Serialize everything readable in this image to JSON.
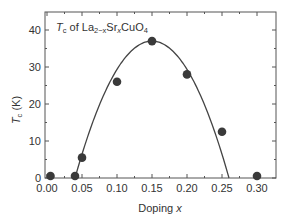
{
  "chart_data": {
    "type": "scatter",
    "title_parts": {
      "T": "T",
      "c_sub": "c",
      "of": " of La",
      "sub1": "2−x",
      "sr": "Sr",
      "sub2": "x",
      "cuo": "CuO",
      "sub3": "4"
    },
    "xlabel": "Doping x",
    "xlabel_parts": {
      "text": "Doping ",
      "var": "x"
    },
    "ylabel": "Tc (K)",
    "ylabel_parts": {
      "T": "T",
      "sub": "c",
      "unit": " (K)"
    },
    "xlim": [
      0.0,
      0.32
    ],
    "ylim": [
      0,
      44
    ],
    "xticks": [
      "0.00",
      "0.05",
      "0.10",
      "0.15",
      "0.20",
      "0.25",
      "0.30"
    ],
    "yticks": [
      "0",
      "10",
      "20",
      "30",
      "40"
    ],
    "grid": false,
    "series": [
      {
        "name": "measured Tc",
        "kind": "markers",
        "color": "#3a3a3a",
        "x": [
          0.005,
          0.04,
          0.05,
          0.1,
          0.15,
          0.2,
          0.25,
          0.3
        ],
        "y": [
          0.2,
          0.2,
          5.5,
          26,
          37,
          28,
          12.5,
          0.3
        ]
      },
      {
        "name": "dome fit",
        "kind": "line",
        "color": "#444444",
        "x": [
          0.04,
          0.06,
          0.08,
          0.1,
          0.12,
          0.14,
          0.15,
          0.16,
          0.18,
          0.2,
          0.22,
          0.24,
          0.26
        ],
        "y": [
          0,
          12.5,
          22.5,
          29.5,
          34.4,
          36.7,
          37,
          36.7,
          34.4,
          29.5,
          22.5,
          12.5,
          0
        ]
      }
    ]
  }
}
